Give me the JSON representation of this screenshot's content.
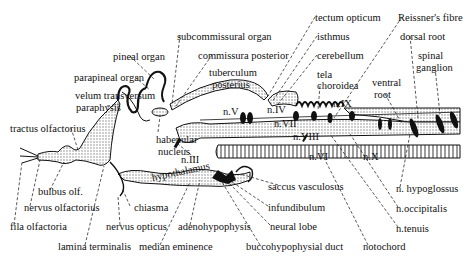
{
  "diagram": {
    "labels": [
      {
        "id": "tectum-opticum",
        "text": "tectum opticum",
        "x": 315,
        "y": 12
      },
      {
        "id": "reissners-fibre",
        "text": "Reissner's fibre",
        "x": 398,
        "y": 12
      },
      {
        "id": "subcommissural-organ",
        "text": "subcommissural organ",
        "x": 177,
        "y": 31
      },
      {
        "id": "isthmus",
        "text": "isthmus",
        "x": 317,
        "y": 31
      },
      {
        "id": "dorsal-root",
        "text": "dorsal root",
        "x": 400,
        "y": 31
      },
      {
        "id": "pineal-organ",
        "text": "pineal organ",
        "x": 113,
        "y": 51
      },
      {
        "id": "commissura-posterior",
        "text": "commissura posterior",
        "x": 198,
        "y": 50
      },
      {
        "id": "cerebellum",
        "text": "cerebellum",
        "x": 317,
        "y": 50
      },
      {
        "id": "spinal",
        "text": "spinal",
        "x": 418,
        "y": 50
      },
      {
        "id": "ganglion",
        "text": "ganglion",
        "x": 416,
        "y": 62
      },
      {
        "id": "tuberculum",
        "text": "tuberculum",
        "x": 209,
        "y": 67
      },
      {
        "id": "posterius",
        "text": "posterius",
        "x": 212,
        "y": 79
      },
      {
        "id": "parapineal-organ",
        "text": "parapineal organ",
        "x": 74,
        "y": 72
      },
      {
        "id": "tela",
        "text": "tela",
        "x": 317,
        "y": 69
      },
      {
        "id": "choroidea",
        "text": "choroidea",
        "x": 317,
        "y": 80
      },
      {
        "id": "ventral",
        "text": "ventral",
        "x": 372,
        "y": 77
      },
      {
        "id": "root",
        "text": "root",
        "x": 374,
        "y": 89
      },
      {
        "id": "velum-transversum",
        "text": "velum  transversum",
        "x": 75,
        "y": 90
      },
      {
        "id": "paraphysis",
        "text": "paraphysis",
        "x": 76,
        "y": 102
      },
      {
        "id": "n-IX",
        "text": "n.IX",
        "x": 333,
        "y": 98
      },
      {
        "id": "n-V",
        "text": "n.V",
        "x": 223,
        "y": 106
      },
      {
        "id": "n-IV",
        "text": "n.IV",
        "x": 267,
        "y": 104
      },
      {
        "id": "n-VII",
        "text": "n.VII",
        "x": 274,
        "y": 118
      },
      {
        "id": "n-VIII",
        "text": "n.VIII",
        "x": 293,
        "y": 131
      },
      {
        "id": "tractus-olfactorius",
        "text": "tractus olfactorius",
        "x": 10,
        "y": 123
      },
      {
        "id": "habenular",
        "text": "habenular",
        "x": 156,
        "y": 134
      },
      {
        "id": "nucleus",
        "text": "nucleus",
        "x": 158,
        "y": 146
      },
      {
        "id": "n-III",
        "text": "n.III",
        "x": 181,
        "y": 154
      },
      {
        "id": "n-VI",
        "text": "n.VI",
        "x": 309,
        "y": 151
      },
      {
        "id": "n-X",
        "text": "n.X",
        "x": 363,
        "y": 151
      },
      {
        "id": "hypothalamus",
        "text": "hypothalamus",
        "x": 153,
        "y": 179
      },
      {
        "id": "saccus-vasculosus",
        "text": "saccus vasculosus",
        "x": 268,
        "y": 181
      },
      {
        "id": "bulbus-olf",
        "text": "bulbus olf.",
        "x": 38,
        "y": 186
      },
      {
        "id": "n-hypoglossus",
        "text": "n. hypoglossus",
        "x": 396,
        "y": 183
      },
      {
        "id": "nervus-olfactorius",
        "text": "nervus olfactorius",
        "x": 24,
        "y": 202
      },
      {
        "id": "chiasma",
        "text": "chiasma",
        "x": 134,
        "y": 202
      },
      {
        "id": "infundibulum",
        "text": "infundibulum",
        "x": 268,
        "y": 202
      },
      {
        "id": "n-occipitalis",
        "text": "n.occipitalis",
        "x": 396,
        "y": 203
      },
      {
        "id": "fila-olfactoria",
        "text": "fila olfactoria",
        "x": 10,
        "y": 221
      },
      {
        "id": "nervus-opticus",
        "text": "nervus opticus",
        "x": 106,
        "y": 221
      },
      {
        "id": "adenohypophysis",
        "text": "adenohypophysis",
        "x": 178,
        "y": 221
      },
      {
        "id": "neural-lobe",
        "text": "neural lobe",
        "x": 270,
        "y": 221
      },
      {
        "id": "n-tenuis",
        "text": "n.tenuis",
        "x": 396,
        "y": 223
      },
      {
        "id": "lamina-terminalis",
        "text": "lamina terminalis",
        "x": 58,
        "y": 241
      },
      {
        "id": "median-eminence",
        "text": "median eminence",
        "x": 139,
        "y": 241
      },
      {
        "id": "buccohypophysial-duct",
        "text": "buccohypophysial duct",
        "x": 246,
        "y": 241
      },
      {
        "id": "notochord",
        "text": "notochord",
        "x": 363,
        "y": 241
      }
    ],
    "colors": {
      "ink": "#111111",
      "stipple": "#c8c8c8",
      "background": "#ffffff"
    }
  }
}
